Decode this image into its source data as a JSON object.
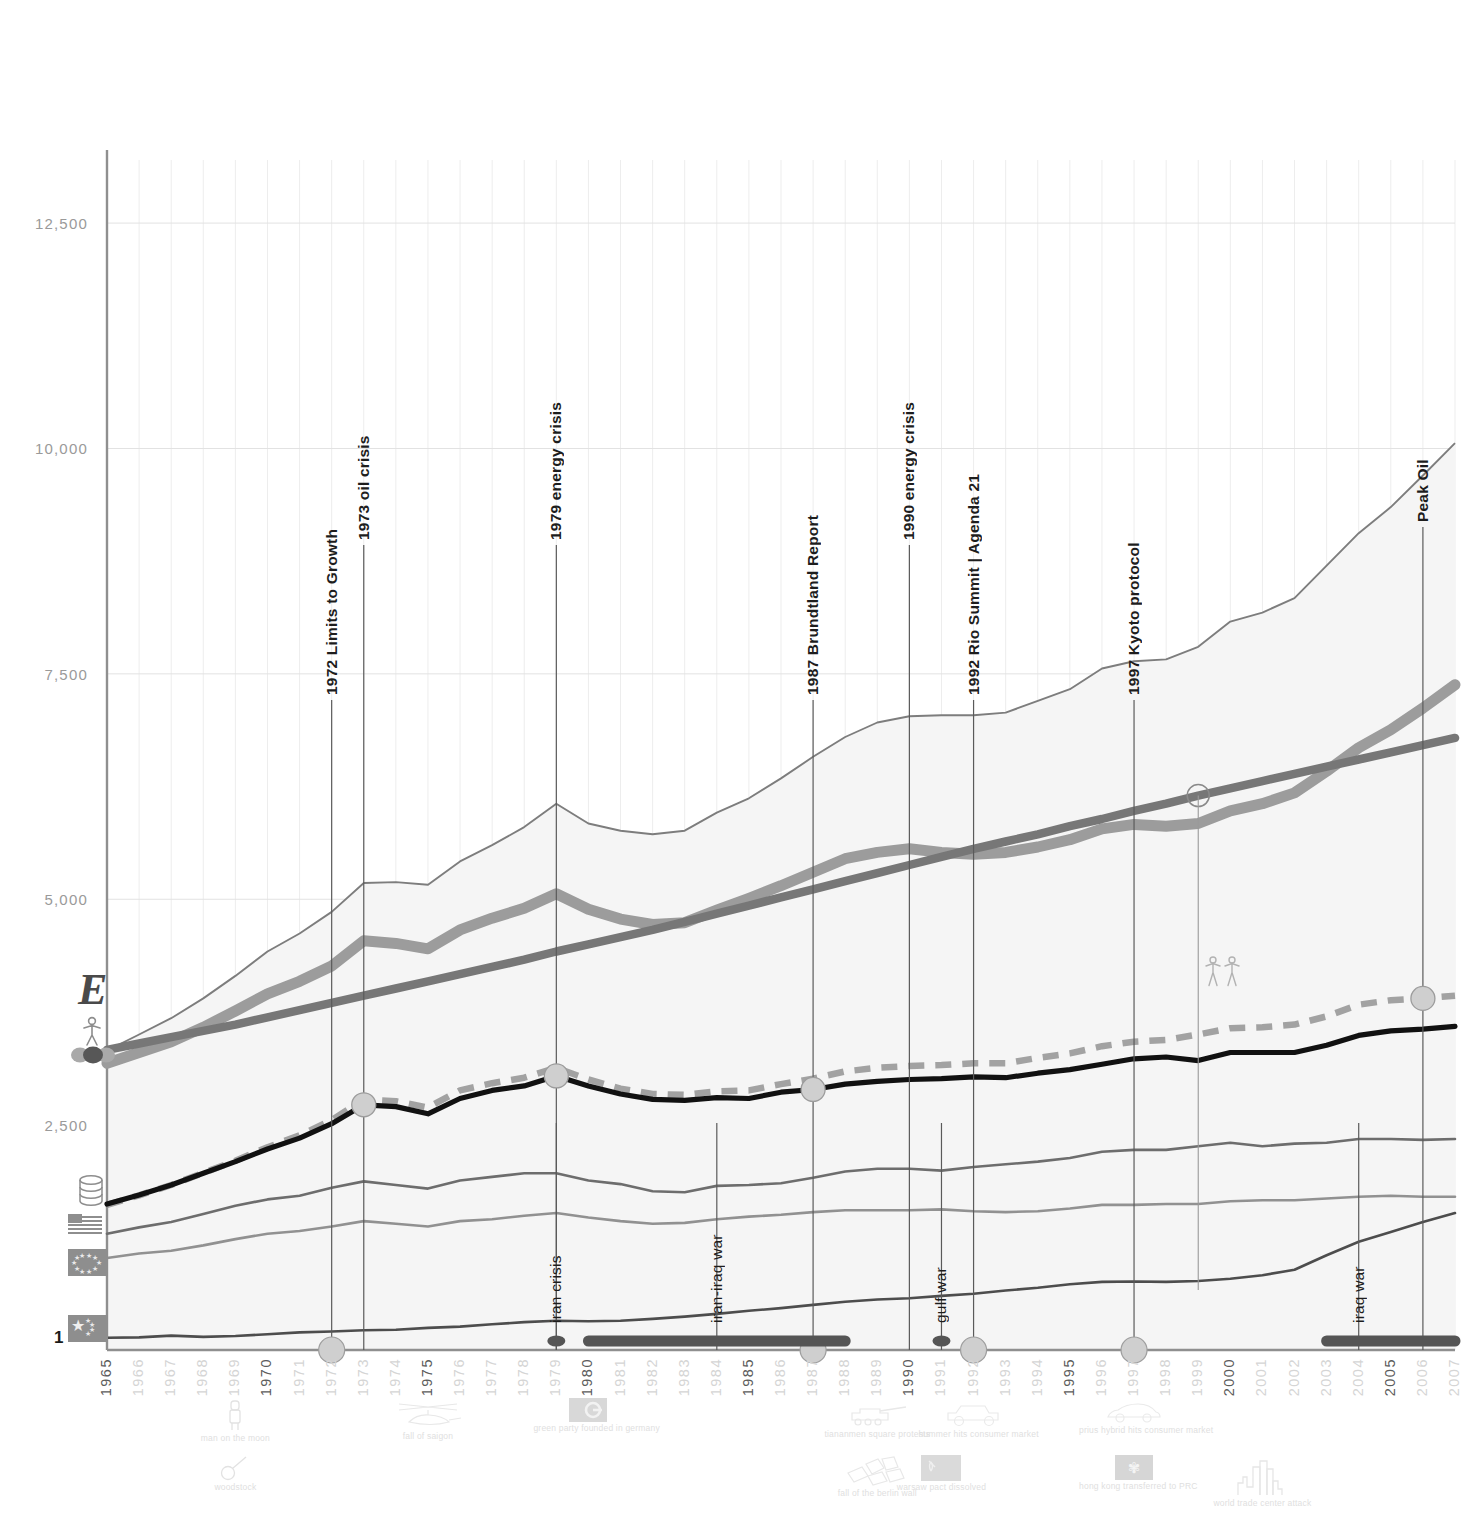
{
  "chart_data": {
    "type": "line",
    "title": "",
    "xlabel": "",
    "ylabel": "",
    "xlim": [
      1965,
      2007
    ],
    "ylim": [
      0,
      13200
    ],
    "yticks": [
      2500,
      5000,
      7500,
      10000,
      12500
    ],
    "ytick_labels": [
      "2,500",
      "5,000",
      "7,500",
      "10,000",
      "12,500"
    ],
    "y_base_label": "1",
    "grid": true,
    "legend_position": "left-axis-icons",
    "x": [
      1965,
      1966,
      1967,
      1968,
      1969,
      1970,
      1971,
      1972,
      1973,
      1974,
      1975,
      1976,
      1977,
      1978,
      1979,
      1980,
      1981,
      1982,
      1983,
      1984,
      1985,
      1986,
      1987,
      1988,
      1989,
      1990,
      1991,
      1992,
      1993,
      1994,
      1995,
      1996,
      1997,
      1998,
      1999,
      2000,
      2001,
      2002,
      2003,
      2004,
      2005,
      2006,
      2007
    ],
    "series": [
      {
        "name": "world total energy consumption",
        "icon": "energy-E-icon",
        "style": "thin-line",
        "color": "#7d7d7d",
        "values": [
          3320,
          3500,
          3680,
          3900,
          4150,
          4420,
          4620,
          4860,
          5180,
          5190,
          5160,
          5420,
          5600,
          5800,
          6060,
          5840,
          5760,
          5720,
          5760,
          5960,
          6120,
          6340,
          6580,
          6800,
          6960,
          7030,
          7040,
          7040,
          7070,
          7200,
          7330,
          7560,
          7640,
          7660,
          7800,
          8080,
          8180,
          8340,
          8700,
          9060,
          9350,
          9700,
          10060
        ]
      },
      {
        "name": "world co2 emissions",
        "icon": "co2-dots-icon",
        "style": "thick-line",
        "color": "#9c9c9c",
        "values": [
          3180,
          3300,
          3420,
          3580,
          3760,
          3950,
          4090,
          4260,
          4540,
          4510,
          4450,
          4660,
          4790,
          4900,
          5060,
          4890,
          4780,
          4720,
          4740,
          4880,
          5010,
          5150,
          5300,
          5450,
          5520,
          5560,
          5520,
          5500,
          5520,
          5580,
          5660,
          5780,
          5830,
          5810,
          5840,
          5980,
          6060,
          6180,
          6420,
          6680,
          6880,
          7120,
          7380
        ]
      },
      {
        "name": "world population",
        "icon": "person-icon",
        "style": "thick-straight-line",
        "color": "#777777",
        "values": [
          3330,
          3400,
          3470,
          3540,
          3610,
          3690,
          3770,
          3850,
          3930,
          4010,
          4090,
          4170,
          4250,
          4330,
          4420,
          4500,
          4580,
          4660,
          4750,
          4840,
          4930,
          5020,
          5110,
          5200,
          5290,
          5380,
          5470,
          5560,
          5640,
          5720,
          5810,
          5890,
          5980,
          6060,
          6150,
          6230,
          6310,
          6390,
          6470,
          6550,
          6630,
          6710,
          6790
        ]
      },
      {
        "name": "world oil production",
        "icon": "oil-barrels-icon",
        "style": "black-line",
        "color": "#111111",
        "values": [
          1620,
          1720,
          1830,
          1960,
          2090,
          2230,
          2350,
          2510,
          2720,
          2700,
          2620,
          2790,
          2880,
          2930,
          3040,
          2930,
          2840,
          2780,
          2770,
          2800,
          2790,
          2860,
          2890,
          2950,
          2980,
          3000,
          3010,
          3030,
          3020,
          3070,
          3110,
          3170,
          3230,
          3250,
          3210,
          3300,
          3300,
          3300,
          3380,
          3490,
          3540,
          3560,
          3590
        ]
      },
      {
        "name": "world oil consumption",
        "icon": "oil-barrels-icon",
        "style": "dashed-line",
        "color": "#a2a2a2",
        "values": [
          1610,
          1715,
          1830,
          1965,
          2100,
          2250,
          2380,
          2550,
          2780,
          2760,
          2690,
          2880,
          2960,
          3020,
          3130,
          3000,
          2900,
          2840,
          2830,
          2870,
          2880,
          2950,
          3010,
          3090,
          3130,
          3150,
          3160,
          3180,
          3180,
          3240,
          3290,
          3370,
          3420,
          3440,
          3500,
          3570,
          3580,
          3610,
          3700,
          3830,
          3880,
          3900,
          3930
        ]
      },
      {
        "name": "united states energy consumption",
        "icon": "us-flag-icon",
        "style": "country-line",
        "color": "#6d6d6d",
        "values": [
          1290,
          1360,
          1420,
          1510,
          1600,
          1670,
          1710,
          1800,
          1870,
          1830,
          1790,
          1880,
          1920,
          1960,
          1960,
          1880,
          1840,
          1760,
          1750,
          1820,
          1830,
          1850,
          1910,
          1980,
          2010,
          2010,
          1990,
          2030,
          2060,
          2090,
          2130,
          2200,
          2220,
          2220,
          2260,
          2300,
          2260,
          2290,
          2300,
          2340,
          2340,
          2330,
          2340
        ]
      },
      {
        "name": "european union energy consumption",
        "icon": "eu-flag-icon",
        "style": "country-line",
        "color": "#919191",
        "values": [
          1020,
          1070,
          1100,
          1160,
          1230,
          1290,
          1320,
          1370,
          1430,
          1400,
          1370,
          1430,
          1450,
          1490,
          1520,
          1470,
          1430,
          1400,
          1410,
          1450,
          1480,
          1500,
          1530,
          1550,
          1550,
          1550,
          1560,
          1540,
          1530,
          1540,
          1570,
          1610,
          1610,
          1620,
          1620,
          1650,
          1660,
          1660,
          1680,
          1700,
          1710,
          1700,
          1700
        ]
      },
      {
        "name": "china energy consumption",
        "icon": "china-flag-icon",
        "style": "country-line",
        "color": "#4d4d4d",
        "values": [
          135,
          140,
          160,
          145,
          155,
          175,
          195,
          205,
          220,
          225,
          245,
          260,
          285,
          310,
          325,
          320,
          325,
          345,
          370,
          400,
          435,
          465,
          500,
          535,
          560,
          575,
          600,
          625,
          660,
          690,
          730,
          755,
          760,
          755,
          765,
          790,
          830,
          890,
          1050,
          1200,
          1310,
          1420,
          1520
        ]
      }
    ],
    "annotations_top": [
      {
        "label": "1972 Limits to Growth",
        "year": 1972,
        "marker": "big-circle"
      },
      {
        "label": "1973 oil crisis",
        "year": 1973,
        "marker": "none"
      },
      {
        "label": "1979 energy crisis",
        "year": 1979,
        "marker": "none"
      },
      {
        "label": "1987 Brundtland Report",
        "year": 1987,
        "marker": "big-circle"
      },
      {
        "label": "1990 energy crisis",
        "year": 1990,
        "marker": "none"
      },
      {
        "label": "1992 Rio Summit | Agenda 21",
        "year": 1992,
        "marker": "big-circle"
      },
      {
        "label": "1997 Kyoto protocol",
        "year": 1997,
        "marker": "big-circle"
      },
      {
        "label": "Peak Oil",
        "year": 2006,
        "marker": "none"
      }
    ],
    "annotations_wars": [
      {
        "label": "iran crisis",
        "year": 1979,
        "marker": "dot",
        "span": null
      },
      {
        "label": "iran-iraq war",
        "year": 1984,
        "marker": "bar",
        "span": [
          1980,
          1988
        ]
      },
      {
        "label": "gulf war",
        "year": 1991,
        "marker": "dot",
        "span": null
      },
      {
        "label": "iraq war",
        "year": 2004,
        "marker": "bar",
        "span": [
          2003,
          2007
        ]
      }
    ],
    "data_point_markers": [
      {
        "series": "world oil production",
        "year": 1973,
        "type": "filled-circle"
      },
      {
        "series": "world oil production",
        "year": 1979,
        "type": "filled-circle"
      },
      {
        "series": "world oil production",
        "year": 1987,
        "type": "filled-circle"
      },
      {
        "series": "world oil consumption",
        "year": 2006,
        "type": "filled-circle"
      },
      {
        "series": "world population",
        "year": 1999,
        "type": "hollow-circle",
        "note": "6 billion people"
      }
    ],
    "culture_icons": [
      {
        "caption": "man on the moon",
        "year": 1969,
        "row": 1,
        "icon": "astronaut-icon"
      },
      {
        "caption": "woodstock",
        "year": 1969,
        "row": 2,
        "icon": "guitar-icon"
      },
      {
        "caption": "fall of saigon",
        "year": 1975,
        "row": 1,
        "icon": "helicopter-icon"
      },
      {
        "caption": "green party founded in germany",
        "year": 1980,
        "row": 1,
        "icon": "green-party-flag-icon"
      },
      {
        "caption": "tiananmen square protests",
        "year": 1989,
        "row": 1,
        "icon": "tank-icon"
      },
      {
        "caption": "fall of the berlin wall",
        "year": 1989,
        "row": 2,
        "icon": "broken-wall-icon"
      },
      {
        "caption": "hummer hits consumer market",
        "year": 1992,
        "row": 1,
        "icon": "hummer-icon"
      },
      {
        "caption": "warsaw pact dissolved",
        "year": 1991,
        "row": 2,
        "icon": "ussr-flag-icon"
      },
      {
        "caption": "prius hybrid hits consumer market",
        "year": 1997,
        "row": 1,
        "icon": "prius-car-icon"
      },
      {
        "caption": "hong kong transferred to PRC",
        "year": 1997,
        "row": 2,
        "icon": "hong-kong-flag-icon"
      },
      {
        "caption": "world trade center attack",
        "year": 2001,
        "row": 2,
        "icon": "twin-towers-icon"
      }
    ],
    "axis_legend_icons": [
      {
        "name": "energy-E-icon",
        "glyph": "E"
      },
      {
        "name": "person-icon",
        "glyph": "person"
      },
      {
        "name": "co2-dots-icon",
        "glyph": "dots"
      },
      {
        "name": "oil-barrels-icon",
        "glyph": "barrels"
      },
      {
        "name": "us-flag-icon",
        "glyph": "us-flag"
      },
      {
        "name": "eu-flag-icon",
        "glyph": "eu-flag"
      },
      {
        "name": "china-flag-icon",
        "glyph": "china-flag"
      }
    ],
    "colors": {
      "total_energy": "#7d7d7d",
      "co2": "#9c9c9c",
      "population": "#777777",
      "oil_production": "#111111",
      "oil_consumption": "#a2a2a2",
      "united_states": "#6d6d6d",
      "european_union": "#919191",
      "china": "#4d4d4d",
      "grid": "#e2e2e2",
      "axis": "#8f8f8f",
      "area_fill": "#f4f4f4",
      "marker_fill": "#cfcfcf",
      "event_marker": "#cfcfcf",
      "war_marker": "#555555"
    }
  }
}
